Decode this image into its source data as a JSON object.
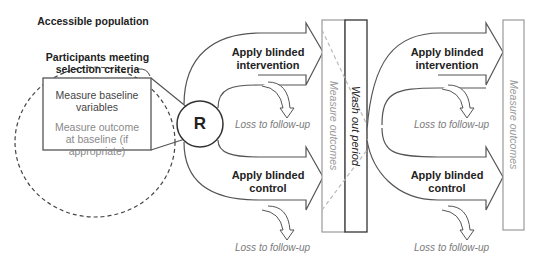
{
  "diagram": {
    "type": "crossover randomized trial flow",
    "accessible_population": "Accessible population",
    "participants_label": "Participants meeting selection criteria",
    "baseline_box": {
      "line1": "Measure baseline variables",
      "line2": "Measure outcome at baseline (if appropriate)"
    },
    "randomization": "R",
    "period1": {
      "intervention": "Apply blinded intervention",
      "control": "Apply blinded control",
      "loss_intervention": "Loss to follow-up",
      "loss_control": "Loss to follow-up",
      "measure": "Measure outcomes"
    },
    "washout": "Wash out period",
    "period2": {
      "intervention": "Apply blinded intervention",
      "control": "Apply blinded control",
      "loss_intervention": "Loss to follow-up",
      "loss_control": "Loss to follow-up",
      "measure": "Measure outcomes"
    },
    "colors": {
      "line": "#555555",
      "dashed_cross": "#bbbbbb",
      "grey_text": "#8a8a8a",
      "black_text": "#222222"
    }
  }
}
